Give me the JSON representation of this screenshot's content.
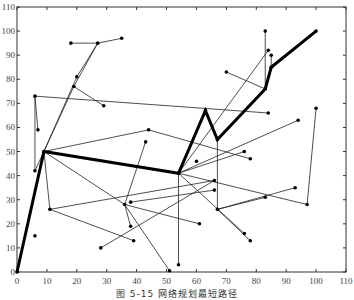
{
  "caption": "图 5-15  网络规划最短路径",
  "chart_data": {
    "type": "network",
    "title": "",
    "xlabel": "",
    "ylabel": "",
    "xlim": [
      0,
      110
    ],
    "ylim": [
      0,
      110
    ],
    "xticks": [
      0,
      10,
      20,
      30,
      40,
      50,
      60,
      70,
      80,
      90,
      100,
      110
    ],
    "yticks": [
      0,
      10,
      20,
      30,
      40,
      50,
      60,
      70,
      80,
      90,
      100,
      110
    ],
    "grid": false,
    "shortest_path": [
      [
        0,
        0
      ],
      [
        9,
        50
      ],
      [
        54,
        41
      ],
      [
        63,
        67
      ],
      [
        67,
        55
      ],
      [
        83,
        76
      ],
      [
        85,
        85
      ],
      [
        100,
        100
      ]
    ],
    "nodes": [
      [
        0,
        0
      ],
      [
        9,
        50
      ],
      [
        54,
        41
      ],
      [
        63,
        67
      ],
      [
        67,
        55
      ],
      [
        83,
        76
      ],
      [
        85,
        85
      ],
      [
        100,
        100
      ],
      [
        6,
        73
      ],
      [
        7,
        59
      ],
      [
        6,
        42
      ],
      [
        6,
        15
      ],
      [
        11,
        26
      ],
      [
        36,
        28
      ],
      [
        38,
        29
      ],
      [
        38,
        19
      ],
      [
        39,
        13
      ],
      [
        28,
        10
      ],
      [
        51,
        0.5
      ],
      [
        18,
        95
      ],
      [
        27,
        95
      ],
      [
        35,
        97
      ],
      [
        20,
        81
      ],
      [
        19,
        77
      ],
      [
        29,
        69
      ],
      [
        44,
        59
      ],
      [
        43,
        54
      ],
      [
        60,
        46
      ],
      [
        66,
        38
      ],
      [
        66,
        34
      ],
      [
        61,
        20
      ],
      [
        54,
        3
      ],
      [
        67,
        26
      ],
      [
        76,
        16
      ],
      [
        78,
        13
      ],
      [
        76,
        50
      ],
      [
        78,
        47
      ],
      [
        83,
        31
      ],
      [
        93,
        35
      ],
      [
        97,
        28
      ],
      [
        100,
        68
      ],
      [
        94,
        63
      ],
      [
        70,
        83
      ],
      [
        83,
        100
      ],
      [
        84,
        92
      ],
      [
        85,
        90
      ],
      [
        84,
        66
      ]
    ],
    "edges": [
      [
        [
          6,
          73
        ],
        [
          7,
          59
        ]
      ],
      [
        [
          6,
          73
        ],
        [
          84,
          66
        ]
      ],
      [
        [
          6,
          73
        ],
        [
          6,
          42
        ]
      ],
      [
        [
          6,
          42
        ],
        [
          9,
          50
        ]
      ],
      [
        [
          19,
          77
        ],
        [
          29,
          69
        ]
      ],
      [
        [
          9,
          50
        ],
        [
          19,
          77
        ]
      ],
      [
        [
          19,
          77
        ],
        [
          27,
          95
        ]
      ],
      [
        [
          9,
          50
        ],
        [
          20,
          81
        ]
      ],
      [
        [
          20,
          81
        ],
        [
          27,
          95
        ]
      ],
      [
        [
          27,
          95
        ],
        [
          18,
          95
        ]
      ],
      [
        [
          27,
          95
        ],
        [
          35,
          97
        ]
      ],
      [
        [
          9,
          50
        ],
        [
          11,
          26
        ]
      ],
      [
        [
          11,
          26
        ],
        [
          39,
          13
        ]
      ],
      [
        [
          11,
          26
        ],
        [
          66,
          38
        ]
      ],
      [
        [
          9,
          50
        ],
        [
          44,
          59
        ]
      ],
      [
        [
          44,
          59
        ],
        [
          78,
          47
        ]
      ],
      [
        [
          9,
          50
        ],
        [
          36,
          28
        ]
      ],
      [
        [
          36,
          28
        ],
        [
          51,
          0.5
        ]
      ],
      [
        [
          36,
          28
        ],
        [
          38,
          19
        ]
      ],
      [
        [
          36,
          28
        ],
        [
          43,
          54
        ]
      ],
      [
        [
          28,
          10
        ],
        [
          66,
          38
        ]
      ],
      [
        [
          38,
          29
        ],
        [
          66,
          34
        ]
      ],
      [
        [
          36,
          28
        ],
        [
          61,
          20
        ]
      ],
      [
        [
          54,
          41
        ],
        [
          54,
          3
        ]
      ],
      [
        [
          54,
          41
        ],
        [
          76,
          16
        ]
      ],
      [
        [
          54,
          41
        ],
        [
          97,
          28
        ]
      ],
      [
        [
          97,
          28
        ],
        [
          100,
          68
        ]
      ],
      [
        [
          54,
          41
        ],
        [
          76,
          50
        ]
      ],
      [
        [
          67,
          55
        ],
        [
          67,
          26
        ]
      ],
      [
        [
          67,
          26
        ],
        [
          93,
          35
        ]
      ],
      [
        [
          67,
          26
        ],
        [
          83,
          31
        ]
      ],
      [
        [
          67,
          26
        ],
        [
          78,
          13
        ]
      ],
      [
        [
          54,
          41
        ],
        [
          84,
          92
        ]
      ],
      [
        [
          70,
          83
        ],
        [
          83,
          76
        ]
      ],
      [
        [
          83,
          100
        ],
        [
          83,
          76
        ]
      ],
      [
        [
          85,
          90
        ],
        [
          85,
          85
        ]
      ],
      [
        [
          54,
          41
        ],
        [
          94,
          63
        ]
      ]
    ]
  }
}
